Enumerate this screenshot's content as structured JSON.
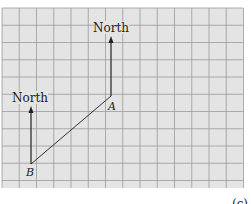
{
  "diagram": {
    "background_color": "#ffffff",
    "grid": {
      "x0": 2,
      "y0": 8,
      "x1": 243,
      "y1": 188,
      "cell": 17.25,
      "fill": "#e4e4e4",
      "line_color": "#9a9a9a"
    },
    "points": [
      {
        "id": "A",
        "label": "A",
        "x": 111,
        "y": 96
      },
      {
        "id": "B",
        "label": "B",
        "x": 31,
        "y": 164
      }
    ],
    "arrows": [
      {
        "id": "north-arrow-a",
        "label": "North",
        "x": 111,
        "y_from": 96,
        "y_to": 37
      },
      {
        "id": "north-arrow-b",
        "label": "North",
        "x": 31,
        "y_from": 164,
        "y_to": 106
      }
    ],
    "segment": {
      "from": "A",
      "to": "B"
    },
    "labels": {
      "north_a": "North",
      "north_b": "North",
      "point_a": "A",
      "point_b": "B",
      "panel": "(c)"
    }
  }
}
